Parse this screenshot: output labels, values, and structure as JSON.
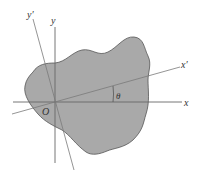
{
  "diagram": {
    "labels": {
      "x": "x",
      "y": "y",
      "x_prime": "x′",
      "y_prime": "y′",
      "origin": "O",
      "angle": "θ"
    },
    "colors": {
      "region_fill": "#a9a9a9",
      "region_stroke": "#555555",
      "axis": "#666666",
      "rotated_axis": "#7a7a7a",
      "background": "#ffffff"
    }
  }
}
